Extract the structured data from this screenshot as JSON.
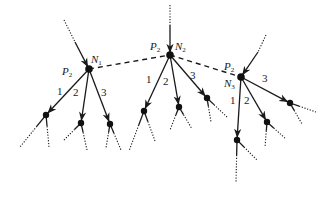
{
  "diagram": {
    "type": "network-tree",
    "nodes": [
      {
        "id": "N1",
        "label": "N",
        "sub": "1",
        "priority_label": "P",
        "priority_sub": "2",
        "x": 89,
        "y": 69,
        "label_pos": [
          91,
          63
        ],
        "p_pos": [
          62,
          75
        ],
        "upstream": {
          "dot_from": [
            64,
            20
          ],
          "solid_from": [
            75,
            42
          ]
        },
        "branch_labels": [
          "1",
          "2",
          "3"
        ],
        "branch_label_pos": [
          [
            57,
            95
          ],
          [
            73,
            96
          ],
          [
            101,
            96
          ]
        ],
        "children": [
          {
            "x": 46,
            "y": 115,
            "leaves": [
              [
                20,
                147
              ],
              [
                49,
                147
              ]
            ]
          },
          {
            "x": 81,
            "y": 123,
            "leaves": [
              [
                63,
                141
              ],
              [
                87,
                150
              ]
            ]
          },
          {
            "x": 110,
            "y": 124,
            "leaves": [
              [
                106,
                148
              ],
              [
                121,
                150
              ]
            ]
          }
        ]
      },
      {
        "id": "N2",
        "label": "N",
        "sub": "2",
        "priority_label": "P",
        "priority_sub": "2",
        "x": 170,
        "y": 55,
        "label_pos": [
          175,
          50
        ],
        "p_pos": [
          150,
          50
        ],
        "upstream": {
          "dot_from": [
            170,
            5
          ],
          "solid_from": [
            170,
            25
          ]
        },
        "branch_labels": [
          "1",
          "2",
          "3"
        ],
        "branch_label_pos": [
          [
            146,
            83
          ],
          [
            163,
            85
          ],
          [
            190,
            79
          ]
        ],
        "children": [
          {
            "x": 144,
            "y": 111,
            "leaves": [
              [
                129,
                151
              ],
              [
                155,
                141
              ]
            ]
          },
          {
            "x": 179,
            "y": 107,
            "leaves": [
              [
                170,
                130
              ],
              [
                192,
                129
              ]
            ]
          },
          {
            "x": 207,
            "y": 98,
            "leaves": [
              [
                211,
                122
              ],
              [
                227,
                117
              ]
            ]
          }
        ]
      },
      {
        "id": "N3",
        "label": "N",
        "sub": "3",
        "priority_label": "P",
        "priority_sub": "2",
        "x": 241,
        "y": 77,
        "label_pos": [
          224,
          87
        ],
        "p_pos": [
          224,
          70
        ],
        "upstream": {
          "dot_from": [
            266,
            35
          ],
          "solid_from": [
            258,
            52
          ]
        },
        "branch_labels": [
          "1",
          "2",
          "3"
        ],
        "branch_label_pos": [
          [
            230,
            104
          ],
          [
            244,
            104
          ],
          [
            262,
            82
          ]
        ],
        "children": [
          {
            "x": 237,
            "y": 140,
            "leaves": [
              [
                236,
                183
              ],
              [
                257,
                160
              ]
            ]
          },
          {
            "x": 267,
            "y": 122,
            "leaves": [
              [
                265,
                147
              ],
              [
                286,
                139
              ]
            ]
          },
          {
            "x": 290,
            "y": 103,
            "leaves": [
              [
                302,
                124
              ],
              [
                316,
                112
              ]
            ]
          }
        ]
      }
    ],
    "links": [
      {
        "from": "N1",
        "to": "N2",
        "style": "dashed"
      },
      {
        "from": "N2",
        "to": "N3",
        "style": "dashed"
      }
    ]
  }
}
